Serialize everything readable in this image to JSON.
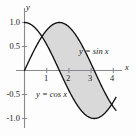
{
  "figure": {
    "background_color": "#fdfdfd",
    "shade_color": "#d9d9d9",
    "curve_color": "#111111",
    "axis_color": "#8a8a93"
  },
  "axes": {
    "x_name": "x",
    "y_name": "y",
    "x_ticks": [
      {
        "value": 1,
        "label": "1"
      },
      {
        "value": 2,
        "label": "2"
      },
      {
        "value": 3,
        "label": "3"
      },
      {
        "value": 4,
        "label": "4"
      }
    ],
    "y_ticks": [
      {
        "value": 1.0,
        "label": "1.0"
      },
      {
        "value": 0.5,
        "label": "0.5"
      },
      {
        "value": -0.5,
        "label": "-0.5"
      },
      {
        "value": -1.0,
        "label": "-1.0"
      }
    ]
  },
  "labels": {
    "sin_label": "y = sin x",
    "cos_label": "y = cos x"
  },
  "chart_data": {
    "type": "line",
    "title": "",
    "xlabel": "x",
    "ylabel": "y",
    "xlim": [
      -0.25,
      4.4
    ],
    "ylim": [
      -1.25,
      1.2
    ],
    "grid": false,
    "legend": "inline-curve-labels",
    "xticks": [
      1,
      2,
      3,
      4
    ],
    "yticks": [
      1.0,
      0.5,
      -0.5,
      -1.0
    ],
    "series": [
      {
        "name": "y = sin x",
        "label": "y = sin x",
        "color": "#111111",
        "x": [
          0,
          0.2,
          0.4,
          0.6,
          0.785,
          1.0,
          1.2,
          1.4,
          1.5708,
          1.8,
          2.0,
          2.2,
          2.4,
          2.6,
          2.8,
          3.0,
          3.1416,
          3.3,
          3.5,
          3.7,
          3.93
        ],
        "values": [
          0.0,
          0.199,
          0.389,
          0.565,
          0.707,
          0.841,
          0.932,
          0.985,
          1.0,
          0.974,
          0.909,
          0.808,
          0.675,
          0.516,
          0.335,
          0.141,
          0.0,
          -0.158,
          -0.351,
          -0.53,
          -0.707
        ]
      },
      {
        "name": "y = cos x",
        "label": "y = cos x",
        "color": "#111111",
        "x": [
          0,
          0.2,
          0.4,
          0.6,
          0.785,
          1.0,
          1.2,
          1.4,
          1.5708,
          1.8,
          2.0,
          2.2,
          2.4,
          2.6,
          2.8,
          3.0,
          3.1416,
          3.3,
          3.5,
          3.7,
          3.93
        ],
        "values": [
          1.0,
          0.98,
          0.921,
          0.825,
          0.707,
          0.54,
          0.362,
          0.17,
          0.0,
          -0.227,
          -0.416,
          -0.589,
          -0.737,
          -0.857,
          -0.942,
          -0.99,
          -1.0,
          -0.987,
          -0.936,
          -0.848,
          -0.707
        ]
      }
    ],
    "shaded_region": {
      "description": "area between y = sin x and y = cos x",
      "x_from": 0.785,
      "x_to": 3.93,
      "fill": "#d9d9d9"
    }
  }
}
